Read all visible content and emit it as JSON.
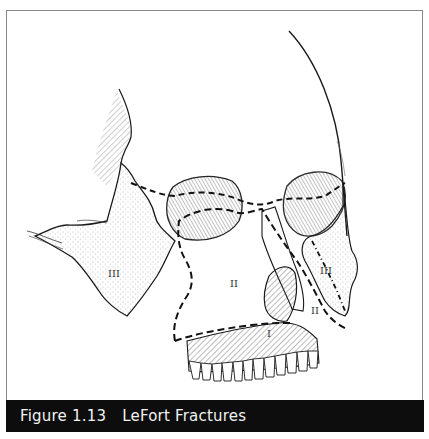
{
  "figure": {
    "number": "Figure 1.13",
    "title": "LeFort Fractures"
  },
  "illustration": {
    "subject": "facial skeleton oblique view",
    "fracture_labels": {
      "left_III": "III",
      "center_II": "II",
      "right_III": "III",
      "right_II": "II",
      "maxilla_I": "I"
    }
  },
  "colors": {
    "caption_bar": "#0d0d0d",
    "caption_text": "#f2f2f2",
    "frame_border": "#8a8a8a",
    "line_art": "#1a1a1a"
  }
}
